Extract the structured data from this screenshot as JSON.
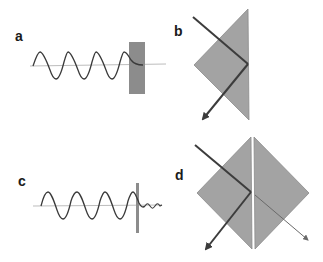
{
  "figure": {
    "colors": {
      "background": "#ffffff",
      "prism_fill": "#a3a3a3",
      "prism_stroke": "#8a8a8a",
      "barrier_fill": "#8c8c8c",
      "wave_stroke": "#3a3a3a",
      "axis_stroke": "#bdbdbd",
      "ray_stroke": "#3c3c3c",
      "transmitted_ray_stroke": "#6a6a6a"
    },
    "panels": [
      {
        "id": "a",
        "label": "a",
        "description": "Sinusoidal wave incident on thick barrier, evanescent decay inside"
      },
      {
        "id": "b",
        "label": "b",
        "description": "Total internal reflection in a single prism"
      },
      {
        "id": "c",
        "label": "c",
        "description": "Sinusoidal wave tunneling through thin barrier, weak transmitted wave"
      },
      {
        "id": "d",
        "label": "d",
        "description": "Frustrated total internal reflection between two prisms with small gap"
      }
    ]
  }
}
